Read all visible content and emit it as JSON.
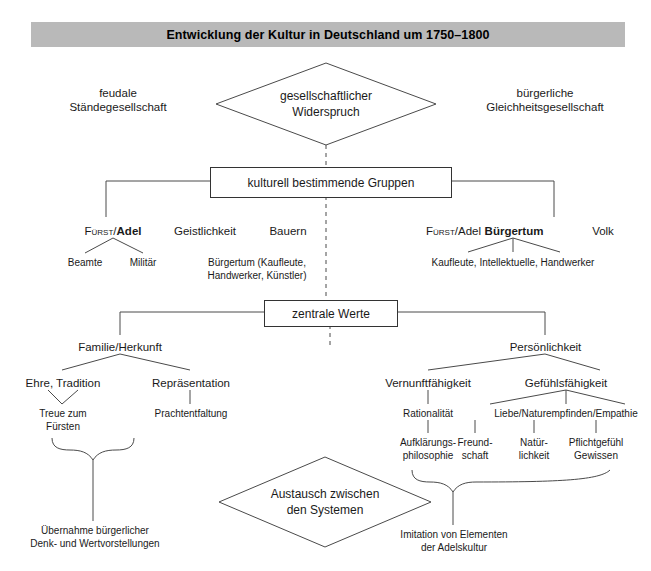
{
  "title": {
    "text": "Entwicklung der Kultur in Deutschland um 1750–1800",
    "background": "#b9b9b9"
  },
  "top": {
    "left_label_line1": "feudale",
    "left_label_line2": "Ständegesellschaft",
    "right_label_line1": "bürgerliche",
    "right_label_line2": "Gleichheitsgesellschaft",
    "diamond_line1": "gesellschaftlicher",
    "diamond_line2": "Widerspruch"
  },
  "groups_box": {
    "label": "kulturell bestimmende Gruppen"
  },
  "groups_left": {
    "item1_prefix": "Fürst",
    "item1_sep": "/",
    "item1_bold": "Adel",
    "item2": "Geistlichkeit",
    "item3": "Bauern",
    "sub_beamte": "Beamte",
    "sub_militaer": "Militär",
    "sub_buergertum_line1": "Bürgertum (Kaufleute,",
    "sub_buergertum_line2": "Handwerker, Künstler)"
  },
  "groups_right": {
    "item1_prefix": "Fürst",
    "item1_sep": "/Adel",
    "item2_bold": "Bürgertum",
    "item3": "Volk",
    "sub_line": "Kaufleute, Intellektuelle, Handwerker"
  },
  "values_box": {
    "label": "zentrale Werte"
  },
  "values_left": {
    "head": "Familie/Herkunft",
    "child1": "Ehre, Tradition",
    "child2": "Repräsentation",
    "leaf1_line1": "Treue zum",
    "leaf1_line2": "Fürsten",
    "leaf2": "Prachtentfaltung",
    "result_line1": "Übernahme bürgerlicher",
    "result_line2": "Denk- und Wertvorstellungen"
  },
  "values_right": {
    "head": "Persönlichkeit",
    "child1": "Vernunftfähigkeit",
    "child2": "Gefühlsfähigkeit",
    "leaf1": "Rationalität",
    "leaf2": "Liebe/Naturempfinden/Empathie",
    "leaf3_line1": "Aufklärungs-",
    "leaf3_line2": "philosophie",
    "leaf4_line1": "Freund-",
    "leaf4_line2": "schaft",
    "leaf5_line1": "Natür-",
    "leaf5_line2": "lichkeit",
    "leaf6_line1": "Pflichtgefühl",
    "leaf6_line2": "Gewissen",
    "result_line1": "Imitation von Elementen",
    "result_line2": "der Adelskultur"
  },
  "bottom": {
    "diamond_line1": "Austausch zwischen",
    "diamond_line2": "den Systemen"
  },
  "colors": {
    "line": "#4a4a4a",
    "text": "#1a1a1a",
    "title_bg": "#b9b9b9",
    "box_border": "#333333"
  }
}
